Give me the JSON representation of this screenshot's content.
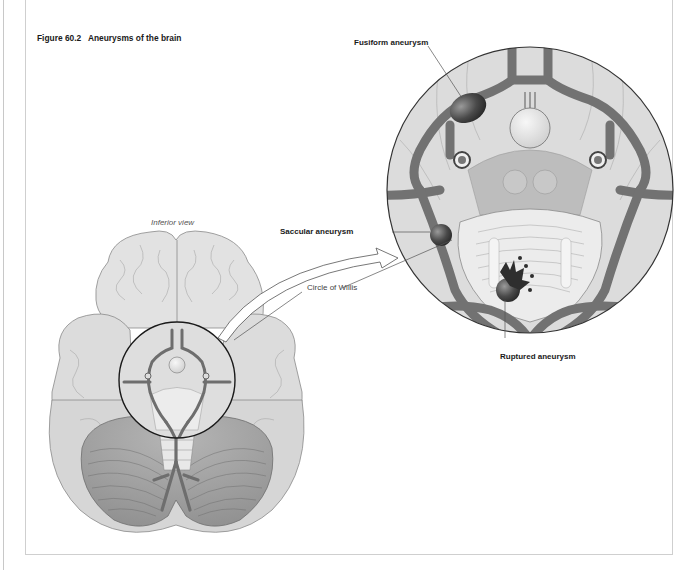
{
  "figure": {
    "number": "Figure 60.2",
    "title": "Aneurysms of the brain",
    "full_title": "Figure 60.2   Aneurysms of the brain"
  },
  "labels": {
    "inferior_view": "Inferior view",
    "fusiform": "Fusiform aneurysm",
    "saccular": "Saccular aneurysm",
    "circle_of_willis": "Circle of Willis",
    "ruptured": "Ruptured aneurysm"
  },
  "illustrations": {
    "brain": "Inferior view of brain with circle highlighting the Circle of Willis",
    "magnified": "Magnified circular inset of Circle of Willis showing three aneurysm types"
  },
  "colors": {
    "frame": "#cfcfcf",
    "vessel": "#7a7a7a",
    "aneurysm": "#3a3a3a",
    "tissue": "#d9d9d9",
    "background": "#ffffff"
  }
}
